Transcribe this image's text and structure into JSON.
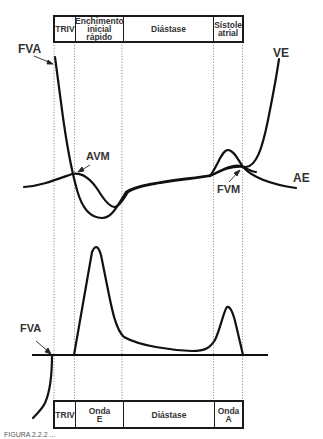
{
  "diagram": {
    "top_phases": [
      {
        "label": "TRIV"
      },
      {
        "label": "Enchimento\ninicial\nrápido"
      },
      {
        "label": "Diástase"
      },
      {
        "label": "Sístole\natrial"
      }
    ],
    "bottom_phases": [
      {
        "label": "TRIV"
      },
      {
        "label": "Onda\nE"
      },
      {
        "label": "Diástase"
      },
      {
        "label": "Onda\nA"
      }
    ],
    "labels": {
      "fva_top": "FVA",
      "ve": "VE",
      "avm": "AVM",
      "fvm": "FVM",
      "ae": "AE",
      "fva_bottom": "FVA"
    },
    "caption": "FIGURA 2.2.2 ..."
  }
}
